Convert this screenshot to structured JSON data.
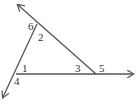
{
  "diagram": {
    "type": "triangle-exterior-angles",
    "vertices": {
      "top": [
        37,
        24
      ],
      "bottom_left": [
        16,
        74
      ],
      "right": [
        96,
        74
      ]
    },
    "rays": {
      "top_left_arrow": [
        18,
        5
      ],
      "bottom_left_arrow": [
        3,
        97
      ],
      "right_arrow": [
        133,
        74
      ]
    },
    "angle_labels": [
      {
        "id": "1",
        "text": "1",
        "x": 22,
        "y": 72
      },
      {
        "id": "2",
        "text": "2",
        "x": 38,
        "y": 41
      },
      {
        "id": "3",
        "text": "3",
        "x": 75,
        "y": 72
      },
      {
        "id": "4",
        "text": "4",
        "x": 14,
        "y": 85
      },
      {
        "id": "5",
        "text": "5",
        "x": 28,
        "y": 30
      },
      {
        "id": "6",
        "text": "6",
        "x": 99,
        "y": 72
      }
    ],
    "line_color": "#555555"
  }
}
